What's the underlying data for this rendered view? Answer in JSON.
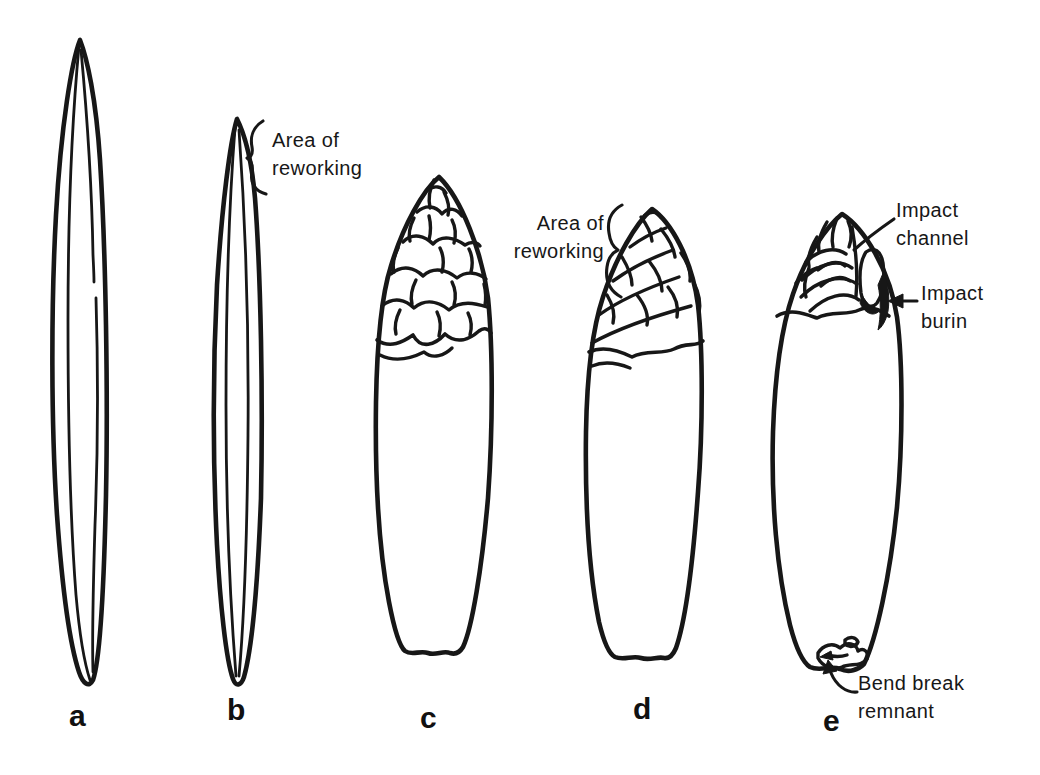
{
  "figure": {
    "background_color": "#ffffff",
    "ink_color": "#171717",
    "panel_labels": {
      "a": "a",
      "b": "b",
      "c": "c",
      "d": "d",
      "e": "e"
    },
    "annotations": {
      "rework_b": {
        "line1": "Area of",
        "line2": "reworking"
      },
      "rework_d": {
        "line1": "Area of",
        "line2": "reworking"
      },
      "impact_channel": {
        "line1": "Impact",
        "line2": "channel"
      },
      "impact_burin": {
        "line1": "Impact",
        "line2": "burin"
      },
      "bend_break": {
        "line1": "Bend break",
        "line2": "remnant"
      }
    }
  }
}
